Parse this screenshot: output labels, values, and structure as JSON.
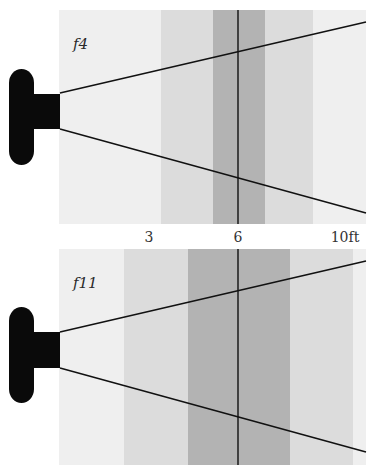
{
  "colors": {
    "background_field": "#efefef",
    "zone_light": "#dcdcdc",
    "zone_dark": "#b3b3b3",
    "camera": "#0a0a0a",
    "lines": "#111111",
    "label_text": "#333333"
  },
  "axis": {
    "ticks": [
      {
        "label": "3",
        "x": 149
      },
      {
        "label": "6",
        "x": 238
      },
      {
        "label": "10ft",
        "x": 345
      }
    ],
    "unit": "ft"
  },
  "panels": [
    {
      "id": "f4",
      "aperture_label": "f4",
      "focus_distance_ft": 6,
      "frame": {
        "x": 59,
        "y": 10,
        "w": 307,
        "h": 214
      },
      "acceptable_zone": {
        "x1": 161,
        "x2": 313
      },
      "sharp_zone": {
        "x1": 213,
        "x2": 265
      },
      "focus_line_x": 238,
      "cone_upper": {
        "x1": 60,
        "y1": 93,
        "x2": 366,
        "y2": 22
      },
      "cone_lower": {
        "x1": 60,
        "y1": 129,
        "x2": 366,
        "y2": 213
      },
      "camera": {
        "body": {
          "x": 9,
          "y": 69,
          "w": 25,
          "h": 96
        },
        "lens": {
          "x": 33,
          "y": 94,
          "w": 27,
          "h": 35
        }
      },
      "label_pos": {
        "x": 73,
        "y": 49
      }
    },
    {
      "id": "f11",
      "aperture_label": "f11",
      "focus_distance_ft": 6,
      "frame": {
        "x": 59,
        "y": 249,
        "w": 307,
        "h": 216
      },
      "acceptable_zone": {
        "x1": 124,
        "x2": 353
      },
      "sharp_zone": {
        "x1": 188,
        "x2": 290
      },
      "focus_line_x": 238,
      "cone_upper": {
        "x1": 60,
        "y1": 332,
        "x2": 366,
        "y2": 261
      },
      "cone_lower": {
        "x1": 60,
        "y1": 368,
        "x2": 366,
        "y2": 452
      },
      "camera": {
        "body": {
          "x": 9,
          "y": 307,
          "w": 25,
          "h": 96
        },
        "lens": {
          "x": 33,
          "y": 332,
          "w": 27,
          "h": 36
        }
      },
      "label_pos": {
        "x": 73,
        "y": 288
      }
    }
  ]
}
